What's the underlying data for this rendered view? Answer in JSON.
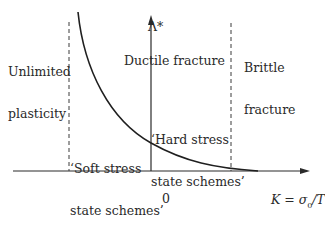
{
  "diagram": {
    "axes": {
      "y_label": "Λ*",
      "x_label": "K = σ0/T",
      "x_label_parts": {
        "var": "K",
        "eq": " = ",
        "num": "σ",
        "sub": "0",
        "den": "/T"
      },
      "origin_label": "0"
    },
    "regions": {
      "left": {
        "line1": "Unlimited",
        "line2": "plasticity"
      },
      "middle": {
        "line1": "Ductile fracture"
      },
      "right": {
        "line1": "Brittle",
        "line2": "fracture"
      }
    },
    "annotations": {
      "soft": {
        "line1": "‘Soft stress",
        "line2": "state schemes’"
      },
      "hard": {
        "line1": "‘Hard stress",
        "line2": "state schemes’"
      }
    },
    "colors": {
      "ink": "#2a2a2a",
      "background": "#ffffff",
      "dashed": "#3a3a3a"
    }
  }
}
